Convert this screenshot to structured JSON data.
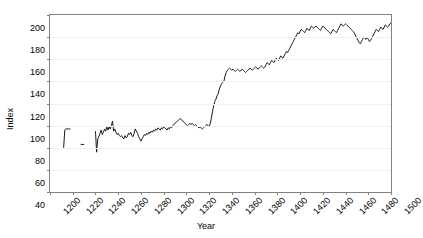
{
  "chart_data": {
    "type": "line",
    "title": "",
    "xlabel": "Year",
    "ylabel": "Index",
    "xlim": [
      1200,
      1500
    ],
    "ylim": [
      40,
      200
    ],
    "xticks": [
      1200,
      1220,
      1240,
      1260,
      1280,
      1300,
      1320,
      1340,
      1360,
      1380,
      1400,
      1420,
      1440,
      1460,
      1480,
      1500
    ],
    "yticks": [
      40,
      60,
      80,
      100,
      120,
      140,
      160,
      180,
      200
    ],
    "grid": true,
    "legend": null,
    "line_color": "#1a1a1a",
    "series": [
      {
        "name": "Index",
        "segments": [
          {
            "x": [
              1212,
              1213,
              1214,
              1215,
              1216,
              1217,
              1218
            ],
            "y": [
              80,
              96,
              97,
              97,
              97,
              97,
              97
            ]
          },
          {
            "x": [
              1227,
              1228,
              1229,
              1230
            ],
            "y": [
              83,
              83,
              83,
              83
            ]
          },
          {
            "x": [
              1240,
              1241,
              1242,
              1243,
              1244,
              1245,
              1246,
              1247,
              1248,
              1249,
              1250,
              1251,
              1252,
              1253,
              1254,
              1255,
              1256,
              1257,
              1258,
              1259,
              1260,
              1261,
              1262,
              1263,
              1264,
              1265,
              1266,
              1267,
              1268,
              1269,
              1270,
              1271,
              1272,
              1273,
              1274,
              1275,
              1276,
              1277,
              1278,
              1279,
              1280,
              1281,
              1282,
              1283,
              1284,
              1285,
              1286,
              1287,
              1288,
              1289,
              1290,
              1291,
              1292,
              1293,
              1294,
              1295,
              1296,
              1297,
              1298,
              1299,
              1300,
              1301,
              1302,
              1303,
              1304,
              1305,
              1306,
              1307,
              1308,
              1309,
              1310,
              1311,
              1312,
              1313,
              1314,
              1315,
              1316,
              1317,
              1318,
              1319,
              1320,
              1321,
              1322,
              1323,
              1324,
              1325,
              1326,
              1327,
              1328,
              1329,
              1330,
              1331,
              1332,
              1333,
              1334,
              1335,
              1336,
              1337,
              1338,
              1339,
              1340,
              1341,
              1342,
              1343,
              1344,
              1345,
              1346,
              1347,
              1348,
              1349,
              1350,
              1351,
              1352,
              1353,
              1354,
              1355,
              1356,
              1357,
              1358,
              1359,
              1360,
              1361,
              1362,
              1363,
              1364,
              1365,
              1366,
              1367,
              1368,
              1369,
              1370,
              1371,
              1372,
              1373,
              1374,
              1375,
              1376,
              1377,
              1378,
              1379,
              1380,
              1381,
              1382,
              1383,
              1384,
              1385,
              1386,
              1387,
              1388,
              1389,
              1390,
              1391,
              1392,
              1393,
              1394,
              1395,
              1396,
              1397,
              1398,
              1399,
              1400,
              1401,
              1402,
              1403,
              1404,
              1405,
              1406,
              1407,
              1408,
              1409,
              1410,
              1411,
              1412,
              1413,
              1414,
              1415,
              1416,
              1417,
              1418,
              1419,
              1420,
              1421,
              1422,
              1423,
              1424,
              1425,
              1426,
              1427,
              1428,
              1429,
              1430,
              1431,
              1432,
              1433,
              1434,
              1435,
              1436,
              1437,
              1438,
              1439,
              1440,
              1441,
              1442,
              1443,
              1444,
              1445,
              1446,
              1447,
              1448,
              1449,
              1450,
              1451,
              1452,
              1453,
              1454,
              1455,
              1456,
              1457,
              1458,
              1459,
              1460,
              1461,
              1462,
              1463,
              1464,
              1465,
              1466,
              1467,
              1468,
              1469,
              1470,
              1471,
              1472,
              1473,
              1474,
              1475,
              1476,
              1477,
              1478,
              1479,
              1480,
              1481,
              1482,
              1483,
              1484,
              1485,
              1486,
              1487,
              1488,
              1489,
              1490,
              1491,
              1492,
              1493,
              1494,
              1495,
              1496,
              1497,
              1498,
              1499,
              1500
            ],
            "y": [
              95,
              76,
              88,
              90,
              93,
              96,
              92,
              94,
              97,
              95,
              99,
              96,
              99,
              97,
              100,
              104,
              95,
              97,
              94,
              92,
              93,
              91,
              90,
              91,
              89,
              88,
              91,
              89,
              90,
              93,
              92,
              94,
              91,
              90,
              93,
              97,
              95,
              93,
              90,
              88,
              86,
              88,
              90,
              92,
              91,
              93,
              92,
              94,
              93,
              95,
              94,
              96,
              95,
              97,
              96,
              98,
              97,
              96,
              98,
              97,
              99,
              98,
              97,
              96,
              98,
              97,
              99,
              98,
              100,
              101,
              102,
              103,
              104,
              105,
              106,
              106,
              105,
              104,
              103,
              102,
              101,
              100,
              101,
              102,
              101,
              102,
              101,
              100,
              101,
              100,
              99,
              98,
              99,
              98,
              97,
              98,
              99,
              100,
              101,
              100,
              99,
              102,
              107,
              113,
              118,
              122,
              124,
              127,
              129,
              133,
              136,
              138,
              139,
              140,
              145,
              148,
              150,
              151,
              152,
              151,
              150,
              151,
              150,
              149,
              150,
              151,
              150,
              149,
              150,
              151,
              150,
              149,
              148,
              149,
              150,
              151,
              152,
              151,
              150,
              151,
              152,
              153,
              152,
              151,
              152,
              153,
              154,
              153,
              152,
              153,
              155,
              157,
              156,
              155,
              157,
              159,
              158,
              157,
              159,
              161,
              160,
              159,
              161,
              163,
              162,
              161,
              163,
              165,
              167,
              166,
              168,
              170,
              172,
              174,
              176,
              178,
              180,
              182,
              184,
              183,
              185,
              187,
              186,
              185,
              184,
              186,
              188,
              187,
              186,
              188,
              190,
              189,
              188,
              189,
              190,
              189,
              188,
              187,
              186,
              188,
              190,
              189,
              188,
              187,
              186,
              185,
              184,
              183,
              185,
              187,
              186,
              185,
              184,
              186,
              188,
              190,
              192,
              191,
              190,
              191,
              192,
              191,
              190,
              189,
              188,
              187,
              186,
              185,
              183,
              181,
              179,
              177,
              175,
              174,
              176,
              178,
              180,
              179,
              178,
              180,
              178,
              176,
              177,
              179,
              181,
              183,
              185,
              187,
              186,
              185,
              187,
              189,
              188,
              187,
              189,
              191,
              190,
              189,
              190,
              192,
              193
            ]
          }
        ]
      }
    ]
  }
}
